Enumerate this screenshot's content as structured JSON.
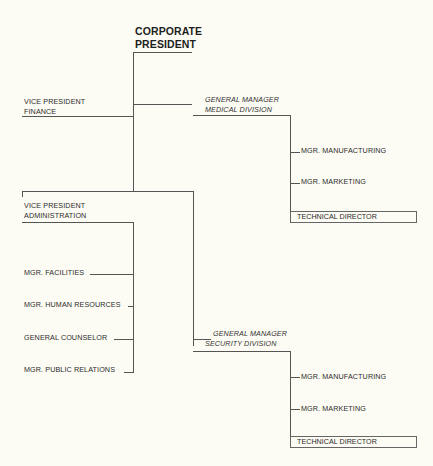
{
  "chart": {
    "president": {
      "line1": "CORPORATE",
      "line2": "PRESIDENT"
    },
    "vp_finance": {
      "line1": "VICE PRESIDENT",
      "line2": "FINANCE"
    },
    "gm_medical": {
      "line1": "GENERAL MANAGER",
      "line2": "MEDICAL DIVISION",
      "reports": [
        "MGR. MANUFACTURING",
        "MGR. MARKETING"
      ],
      "technical": "TECHNICAL DIRECTOR"
    },
    "vp_admin": {
      "line1": "VICE PRESIDENT",
      "line2": "ADMINISTRATION",
      "reports": [
        "MGR. FACILITIES",
        "MGR. HUMAN RESOURCES",
        "GENERAL COUNSELOR",
        "MGR. PUBLIC RELATIONS"
      ]
    },
    "gm_security": {
      "line1": "GENERAL MANAGER",
      "line2": "SECURITY DIVISION",
      "reports": [
        "MGR. MANUFACTURING",
        "MGR. MARKETING"
      ],
      "technical": "TECHNICAL DIRECTOR"
    }
  },
  "colors": {
    "background": "#fdfcf4",
    "line": "#555555",
    "text": "#2a2a2a"
  }
}
